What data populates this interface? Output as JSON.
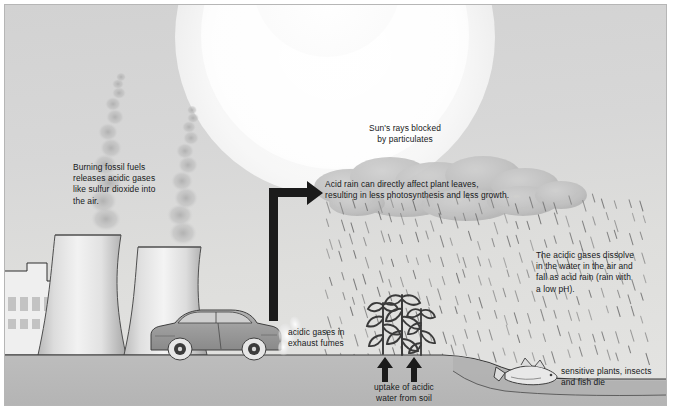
{
  "diagram": {
    "frame": {
      "border_color": "#b6b6b6",
      "sky_color": "#d6d6d6",
      "ground_color": "#b9b9b9"
    }
  },
  "labels": {
    "fossil_fuels": "Burning fossil fuels\nreleases acidic gases\nlike sulfur dioxide into\nthe air.",
    "sun_blocked": "Sun's rays blocked\nby particulates",
    "acid_rain_leaves": "Acid rain can directly affect plant leaves,\nresulting in less photosynthesis and less growth.",
    "gases_dissolve": "The acidic gases dissolve\nin the water in the air and\nfall as acid rain (rain with\na low pH).",
    "exhaust_fumes": "acidic gases in\nexhaust fumes",
    "uptake": "uptake of acidic\nwater from soil",
    "fish_die": "sensitive plants, insects\nand fish die"
  },
  "scene": {
    "sun": {
      "name": "sun-glow",
      "circles": 3
    },
    "towers": [
      {
        "name": "cooling-tower-left",
        "x": 48,
        "y": 228
      },
      {
        "name": "cooling-tower-right",
        "x": 129,
        "y": 238
      }
    ],
    "building": {
      "name": "factory-building",
      "window_rows": 2,
      "windows_top": 4,
      "windows_bottom": 3
    },
    "smoke_plumes": 2,
    "car": {
      "name": "car",
      "color": "#9a9a9a",
      "wheels": 2
    },
    "clouds": 5,
    "rain": {
      "streaks": 150,
      "angle_deg": 17
    },
    "plants": {
      "count": 3,
      "state": "wilting"
    },
    "uptake_arrows": 2,
    "fish": {
      "name": "dead-fish",
      "count": 1
    },
    "pond": {
      "name": "pond"
    }
  },
  "colors": {
    "text": "#16181a",
    "arrow": "#1b1b1b",
    "ground": "#b9b9b9",
    "ground_line": "#3a3a3a",
    "tower": "#e6e6e6",
    "car_body": "#9d9d9d",
    "cloud": "#c0c0c0",
    "rain": "#6e6e6e",
    "plant": "#4a4a4a"
  }
}
